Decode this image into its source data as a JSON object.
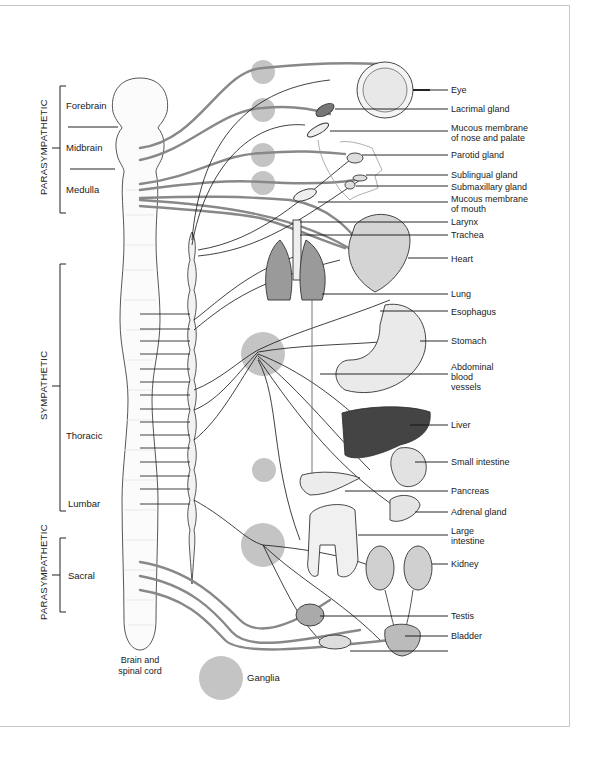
{
  "diagram": {
    "divisions": [
      {
        "label": "PARASYMPATHETIC",
        "region": "cranial"
      },
      {
        "label": "SYMPATHETIC",
        "region": "thoracolumbar"
      },
      {
        "label": "PARASYMPATHETIC",
        "region": "sacral"
      }
    ],
    "cns_regions": [
      "Forebrain",
      "Midbrain",
      "Medulla",
      "Thoracic",
      "Lumbar",
      "Sacral"
    ],
    "cns_caption": [
      "Brain and",
      "spinal cord"
    ],
    "legend": {
      "ganglia_label": "Ganglia",
      "ganglia_color": "#c4c4c4"
    },
    "organs": [
      {
        "label": "Eye"
      },
      {
        "label": "Lacrimal gland"
      },
      {
        "label": "Mucous membrane",
        "label2": "of nose and palate"
      },
      {
        "label": "Parotid gland"
      },
      {
        "label": "Sublingual gland"
      },
      {
        "label": "Submaxillary gland"
      },
      {
        "label": "Mucous membrane",
        "label2": "of mouth"
      },
      {
        "label": "Larynx"
      },
      {
        "label": "Trachea"
      },
      {
        "label": "Heart"
      },
      {
        "label": "Lung"
      },
      {
        "label": "Esophagus"
      },
      {
        "label": "Stomach"
      },
      {
        "label": "Abdominal",
        "label2": "blood",
        "label3": "vessels"
      },
      {
        "label": "Liver"
      },
      {
        "label": "Small intestine"
      },
      {
        "label": "Pancreas"
      },
      {
        "label": "Adrenal gland"
      },
      {
        "label": "Large",
        "label2": "intestine"
      },
      {
        "label": "Kidney"
      },
      {
        "label": "Testis"
      },
      {
        "label": "Bladder"
      }
    ],
    "colors": {
      "postganglionic_fiber": "#888888",
      "preganglionic_fiber": "#111111",
      "frame": "#c8c8c8"
    }
  }
}
